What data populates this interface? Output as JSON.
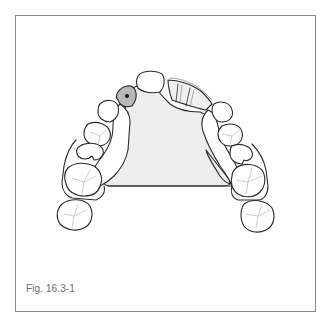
{
  "figure": {
    "caption": "Fig. 16.3-1",
    "colors": {
      "outline": "#2a2a2a",
      "frame_border": "#8a8a8a",
      "palatal_plate_fill": "#eeeeee",
      "highlighted_tooth_fill": "#b8b8b8",
      "marker_dot": "#111111",
      "tooth_fill": "#ffffff",
      "fissure_lines": "#9a9a9a",
      "bridge_fill": "#f0f0f0"
    },
    "elements": {
      "palatal_plate": "palatal-connector",
      "highlighted_tooth": "abutment-with-marker",
      "bridge_segment": "pontic-bridge-right-anterior",
      "teeth_left": [
        "lateral-incisor",
        "canine",
        "premolar-1",
        "premolar-2",
        "molar-1",
        "molar-2"
      ],
      "teeth_right": [
        "canine",
        "premolar-1",
        "premolar-2",
        "molar-1",
        "molar-2"
      ],
      "central_tooth": "central-incisor"
    }
  }
}
